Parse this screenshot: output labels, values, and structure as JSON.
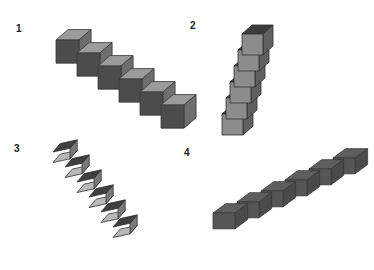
{
  "figure": {
    "background_color": "#ffffff",
    "width": 374,
    "height": 270
  },
  "panels": [
    {
      "id": "panel-1",
      "label": "1",
      "label_x": 16,
      "label_y": 24,
      "cube_count": 6,
      "arrangement": "descending staircase to the lower-right",
      "origin_x": 56,
      "origin_y": 40,
      "step_x": 21,
      "step_y": 13,
      "cube_size": 23,
      "skew": 0.52,
      "depth": 11,
      "colors": {
        "top": "#9b9b9b",
        "left": "#4c4c4c",
        "right": "#6e6e6e",
        "bottom": "#c9c9c9",
        "outline": "#3a3a3a"
      }
    },
    {
      "id": "panel-2",
      "label": "2",
      "label_x": 3,
      "label_y": 21,
      "cube_count": 6,
      "arrangement": "near-vertical column leaning slightly left toward the bottom",
      "origin_x": 55,
      "origin_y": 34,
      "step_x": -4,
      "step_y": 16,
      "cube_size": 21,
      "skew": 0.5,
      "depth": 10,
      "colors": {
        "top": "#3c3c3c",
        "left": "#8c8c8c",
        "right": "#606060",
        "bottom": "#b5b5b5",
        "outline": "#2e2e2e"
      }
    },
    {
      "id": "panel-3",
      "label": "3",
      "label_x": 14,
      "label_y": 9,
      "cube_count": 6,
      "arrangement": "steep staircase descending to the lower-right",
      "origin_x": 53,
      "origin_y": 17,
      "step_x": 12,
      "step_y": 15,
      "cube_size": 17,
      "skew": 0.48,
      "depth": 8,
      "colors": {
        "top": "#3f3f3f",
        "left": "#b9b9b9",
        "right": "#7a7a7a",
        "bottom": "#cfcfcf",
        "outline": "#313131"
      }
    },
    {
      "id": "panel-4",
      "label": "4",
      "label_x": -3,
      "label_y": 13,
      "cube_count": 6,
      "arrangement": "ascending staircase to the upper-right",
      "origin_x": 26,
      "origin_y": 78,
      "step_x": 24,
      "step_y": -11,
      "cube_size": 22,
      "skew": 0.5,
      "depth": 11,
      "colors": {
        "top": "#5e5e5e",
        "left": "#565656",
        "right": "#4a4a4a",
        "bottom": "#676767",
        "outline": "#3a3a3a"
      }
    }
  ]
}
